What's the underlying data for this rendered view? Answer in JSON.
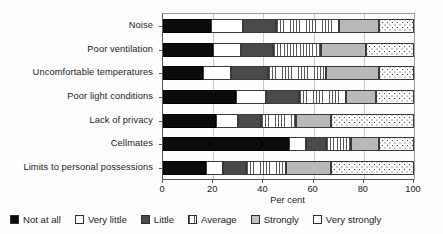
{
  "chart_data": {
    "type": "bar",
    "orientation": "horizontal",
    "stacked": true,
    "title": "",
    "xlabel": "Per cent",
    "ylabel": "",
    "xlim": [
      0,
      100
    ],
    "xticks": [
      0,
      20,
      40,
      60,
      80,
      100
    ],
    "xtick_labels": [
      "0",
      "20",
      "40",
      "60",
      "80",
      "100"
    ],
    "grid": true,
    "legend_position": "bottom",
    "categories": [
      "Noise",
      "Poor ventilation",
      "Uncomfortable temperatures",
      "Poor light conditions",
      "Lack of privacy",
      "Cellmates",
      "Limits to personal possessions"
    ],
    "series": [
      {
        "name": "Not at all",
        "color": "#0b0b0b",
        "pattern": "solid-black",
        "values": [
          19,
          20,
          16,
          29,
          21,
          50,
          17
        ]
      },
      {
        "name": "Very little",
        "color": "#ffffff",
        "pattern": "solid-white",
        "values": [
          13,
          11,
          11,
          12,
          9,
          7,
          7
        ]
      },
      {
        "name": "Little",
        "color": "#4a4a4a",
        "pattern": "solid-gray",
        "values": [
          13,
          13,
          15,
          13,
          9,
          8,
          9
        ]
      },
      {
        "name": "Average",
        "color": "#f2f2f2",
        "pattern": "vertical-lines",
        "values": [
          25,
          19,
          23,
          19,
          14,
          10,
          16
        ]
      },
      {
        "name": "Strongly",
        "color": "#b9b9b9",
        "pattern": "solid-lightgray",
        "values": [
          16,
          18,
          21,
          12,
          14,
          11,
          18
        ]
      },
      {
        "name": "Very strongly",
        "color": "#ffffff",
        "pattern": "dots",
        "values": [
          14,
          19,
          14,
          15,
          33,
          14,
          33
        ]
      }
    ]
  },
  "axis": {
    "x_title": "Per cent",
    "tick_labels": [
      "0",
      "20",
      "40",
      "60",
      "80",
      "100"
    ]
  },
  "legend": {
    "items": [
      {
        "label": "Not at all"
      },
      {
        "label": "Very little"
      },
      {
        "label": "Little"
      },
      {
        "label": "Average"
      },
      {
        "label": "Strongly"
      },
      {
        "label": "Very strongly"
      }
    ]
  }
}
